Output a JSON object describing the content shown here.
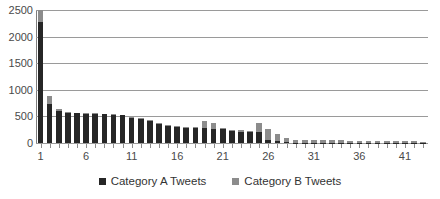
{
  "chart_data": {
    "type": "bar",
    "subtype": "stacked-column",
    "title": "",
    "xlabel": "",
    "ylabel": "",
    "ylim": [
      0,
      2500
    ],
    "yticks": [
      0,
      500,
      1000,
      1500,
      2000,
      2500
    ],
    "ytick_labels": [
      "0",
      "500",
      "1000",
      "1500",
      "2000",
      "2500"
    ],
    "grid": "horizontal",
    "legend_position": "bottom",
    "categories": [
      1,
      2,
      3,
      4,
      5,
      6,
      7,
      8,
      9,
      10,
      11,
      12,
      13,
      14,
      15,
      16,
      17,
      18,
      19,
      20,
      21,
      22,
      23,
      24,
      25,
      26,
      27,
      28,
      29,
      30,
      31,
      32,
      33,
      34,
      35,
      36,
      37,
      38,
      39,
      40,
      41,
      42,
      43
    ],
    "xtick_labels": [
      "1",
      "6",
      "11",
      "16",
      "21",
      "26",
      "31",
      "36",
      "41"
    ],
    "xtick_positions": [
      1,
      6,
      11,
      16,
      21,
      26,
      31,
      36,
      41
    ],
    "series": [
      {
        "name": "Category A Tweets",
        "color": "#262626",
        "values": [
          2280,
          740,
          600,
          565,
          560,
          550,
          545,
          540,
          530,
          525,
          470,
          450,
          410,
          355,
          325,
          295,
          280,
          275,
          275,
          270,
          255,
          225,
          215,
          210,
          205,
          55,
          30,
          10,
          8,
          6,
          5,
          5,
          4,
          4,
          4,
          3,
          3,
          3,
          3,
          3,
          2,
          2,
          2
        ]
      },
      {
        "name": "Category B Tweets",
        "color": "#8c8c8c",
        "values": [
          270,
          135,
          35,
          15,
          10,
          10,
          10,
          10,
          10,
          10,
          10,
          15,
          15,
          15,
          20,
          25,
          25,
          25,
          145,
          100,
          25,
          25,
          25,
          20,
          170,
          210,
          135,
          80,
          55,
          50,
          45,
          45,
          45,
          45,
          40,
          40,
          40,
          35,
          35,
          35,
          30,
          30,
          25
        ]
      }
    ]
  },
  "legend": {
    "items": [
      {
        "label": "Category A Tweets",
        "color": "#262626"
      },
      {
        "label": "Category B Tweets",
        "color": "#8c8c8c"
      }
    ]
  }
}
